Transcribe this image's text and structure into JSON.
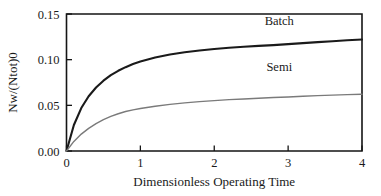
{
  "chart_data": {
    "type": "line",
    "title": "",
    "subtitle": "",
    "xlabel": "Dimensionless Operating Time",
    "ylabel": "Nw/(Ntot)0",
    "xlim": [
      0,
      4
    ],
    "ylim": [
      0.0,
      0.15
    ],
    "xticks": [
      "0",
      "1",
      "2",
      "3",
      "4"
    ],
    "xtick_values": [
      0,
      1,
      2,
      3,
      4
    ],
    "yticks": [
      "0.00",
      "0.05",
      "0.10",
      "0.15"
    ],
    "ytick_values": [
      0.0,
      0.05,
      0.1,
      0.15
    ],
    "grid": false,
    "legend": "inline-annotations",
    "x": [
      0,
      0.1,
      0.2,
      0.3,
      0.4,
      0.5,
      0.6,
      0.7,
      0.8,
      0.9,
      1.0,
      1.2,
      1.4,
      1.6,
      1.8,
      2.0,
      2.2,
      2.4,
      2.6,
      2.8,
      3.0,
      3.2,
      3.4,
      3.6,
      3.8,
      4.0
    ],
    "series": [
      {
        "name": "Batch",
        "color": "#1a1a1a",
        "width": 2.1,
        "annotation": "Batch",
        "annotation_x": 2.88,
        "annotation_y": 0.1385,
        "values": [
          0.0,
          0.0285,
          0.047,
          0.06,
          0.0695,
          0.077,
          0.083,
          0.0878,
          0.0918,
          0.0952,
          0.098,
          0.1024,
          0.1057,
          0.1082,
          0.1101,
          0.1117,
          0.113,
          0.1141,
          0.1151,
          0.1159,
          0.117,
          0.1181,
          0.1192,
          0.1202,
          0.1212,
          0.122
        ]
      },
      {
        "name": "Semi",
        "color": "#7a7a7a",
        "width": 1.4,
        "annotation": "Semi",
        "annotation_x": 2.88,
        "annotation_y": 0.0875,
        "values": [
          0.0,
          0.0105,
          0.0185,
          0.0248,
          0.03,
          0.0343,
          0.0379,
          0.0408,
          0.0432,
          0.045,
          0.0465,
          0.049,
          0.051,
          0.0527,
          0.0541,
          0.0552,
          0.0562,
          0.057,
          0.0578,
          0.0585,
          0.0592,
          0.0599,
          0.0606,
          0.0612,
          0.0617,
          0.0622
        ]
      }
    ]
  },
  "axes": {
    "x_title": "Dimensionless Operating Time",
    "y_title": "Nw/(Ntot)0"
  }
}
